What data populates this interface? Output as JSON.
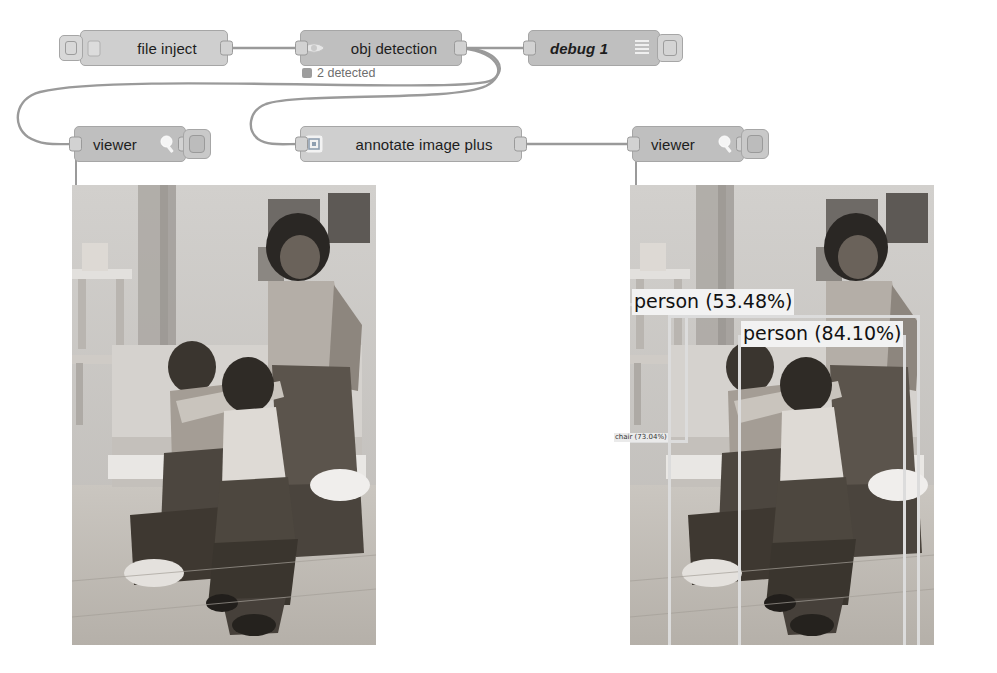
{
  "flow": {
    "nodes": [
      {
        "id": "file-inject",
        "label": "file inject",
        "type": "inject",
        "status": null,
        "icon": "file-icon"
      },
      {
        "id": "obj-detection",
        "label": "obj detection",
        "type": "function",
        "status": "2 detected",
        "icon": "eye-icon"
      },
      {
        "id": "debug-1",
        "label": "debug 1",
        "type": "debug",
        "status": null,
        "icon": "debug-bars-icon"
      },
      {
        "id": "viewer-left",
        "label": "viewer",
        "type": "viewer",
        "status": null,
        "icon": "magnifier-icon"
      },
      {
        "id": "annotate-image-plus",
        "label": "annotate image plus",
        "type": "annotate",
        "status": null,
        "icon": "frame-icon"
      },
      {
        "id": "viewer-right",
        "label": "viewer",
        "type": "viewer",
        "status": null,
        "icon": "magnifier-icon"
      }
    ]
  },
  "detections": {
    "count_label": "2 detected",
    "labels": [
      {
        "text": "person (53.48%)",
        "class": "person",
        "confidence": "53.48%"
      },
      {
        "text": "person (84.10%)",
        "class": "person",
        "confidence": "84.10%"
      },
      {
        "text": "chair (73.04%)",
        "class": "chair",
        "confidence": "73.04%"
      }
    ]
  },
  "previews": {
    "left": {
      "name": "original image",
      "annotated": false
    },
    "right": {
      "name": "annotated image",
      "annotated": true
    }
  },
  "colors": {
    "node_fill": "#bfbfbf",
    "node_fill_light": "#cfcfcf",
    "node_border": "#a6a6a6",
    "wire": "#999999",
    "bbox": "#dcdcdc",
    "label_bg": "#f2f2f2",
    "status_text": "#6e6e6e"
  }
}
